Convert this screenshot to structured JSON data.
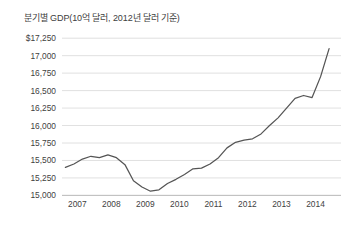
{
  "chart_data": {
    "type": "line",
    "title": "분기별 GDP(10억 달러, 2012년 달러 기준)",
    "xlabel": "",
    "ylabel": "",
    "grid": true,
    "legend": false,
    "legend_position": "none",
    "line_color": "#555555",
    "gridline_color": "#d8d8d8",
    "axis_color": "#b9b9b9",
    "background_color": "#ffffff",
    "ylim": [
      15000,
      17250
    ],
    "ytick_step": 250,
    "ytick_labels": [
      "$17,250",
      "17,000",
      "16,750",
      "16,500",
      "16,250",
      "16,000",
      "15,750",
      "15,500",
      "15,250",
      "15,000"
    ],
    "ytick_values": [
      17250,
      17000,
      16750,
      16500,
      16250,
      16000,
      15750,
      15500,
      15250,
      15000
    ],
    "xtick_labels": [
      "2007",
      "2008",
      "2009",
      "2010",
      "2011",
      "2012",
      "2013",
      "2014"
    ],
    "xlim": [
      2006.9,
      2015.1
    ],
    "x": [
      2007.0,
      2007.25,
      2007.5,
      2007.75,
      2008.0,
      2008.25,
      2008.5,
      2008.75,
      2009.0,
      2009.25,
      2009.5,
      2009.75,
      2010.0,
      2010.25,
      2010.5,
      2010.75,
      2011.0,
      2011.25,
      2011.5,
      2011.75,
      2012.0,
      2012.25,
      2012.5,
      2012.75,
      2013.0,
      2013.25,
      2013.5,
      2013.75,
      2014.0,
      2014.25,
      2014.5,
      2014.75
    ],
    "values": [
      15400,
      15450,
      15520,
      15560,
      15540,
      15580,
      15540,
      15440,
      15210,
      15120,
      15060,
      15080,
      15170,
      15230,
      15300,
      15380,
      15390,
      15450,
      15540,
      15680,
      15760,
      15790,
      15810,
      15880,
      16000,
      16110,
      16250,
      16390,
      16430,
      16400,
      16700,
      17100
    ],
    "series": [
      {
        "name": "분기별 GDP",
        "values": [
          15400,
          15450,
          15520,
          15560,
          15540,
          15580,
          15540,
          15440,
          15210,
          15120,
          15060,
          15080,
          15170,
          15230,
          15300,
          15380,
          15390,
          15450,
          15540,
          15680,
          15760,
          15790,
          15810,
          15880,
          16000,
          16110,
          16250,
          16390,
          16430,
          16400,
          16700,
          17100
        ]
      }
    ]
  }
}
